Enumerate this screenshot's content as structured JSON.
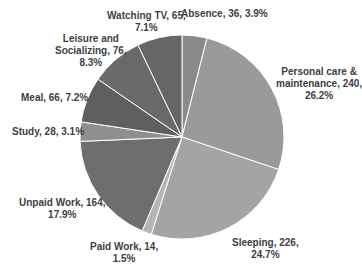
{
  "chart_data": {
    "type": "pie",
    "title": "",
    "start_angle_deg": 0,
    "direction": "clockwise",
    "total": 915,
    "categories": [
      "Absence",
      "Personal care & maintenance",
      "Sleeping",
      "Paid Work",
      "Unpaid Work",
      "Study",
      "Meal",
      "Leisure and Socializing",
      "Watching TV"
    ],
    "values": [
      36,
      240,
      226,
      14,
      164,
      28,
      66,
      76,
      65
    ],
    "percentages": [
      "3.9%",
      "26.2%",
      "24.7%",
      "1.5%",
      "17.9%",
      "3.1%",
      "7.2%",
      "8.3%",
      "7.1%"
    ],
    "colors": [
      "#8a8a8a",
      "#9a9a9a",
      "#a4a4a4",
      "#b5b5b5",
      "#6e6e6e",
      "#8f8f8f",
      "#5f5f5f",
      "#6a6a6a",
      "#666666"
    ],
    "legend": "none",
    "data_labels": "category, value, percentage"
  },
  "labels": [
    {
      "lines": [
        "Absence, 36, 3.9%"
      ]
    },
    {
      "lines": [
        "Personal care &",
        "maintenance, 240,",
        "26.2%"
      ]
    },
    {
      "lines": [
        "Sleeping, 226,",
        "24.7%"
      ]
    },
    {
      "lines": [
        "Paid Work, 14,",
        "1.5%"
      ]
    },
    {
      "lines": [
        "Unpaid Work, 164,",
        "17.9%"
      ]
    },
    {
      "lines": [
        "Study, 28, 3.1%"
      ]
    },
    {
      "lines": [
        "Meal, 66, 7.2%"
      ]
    },
    {
      "lines": [
        "Leisure and",
        "Socializing, 76,",
        "8.3%"
      ]
    },
    {
      "lines": [
        "Watching TV, 65,",
        "7.1%"
      ]
    }
  ]
}
